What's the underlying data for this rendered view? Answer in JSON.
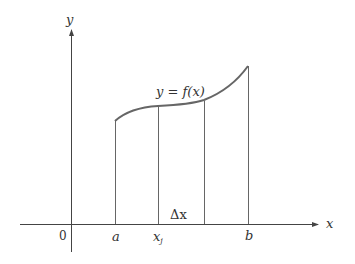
{
  "diagram": {
    "axes": {
      "x_label": "x",
      "y_label": "y",
      "origin_label": "0"
    },
    "curve": {
      "label": "y = f(x)",
      "color": "#555555"
    },
    "ticks": {
      "a": "a",
      "xj": "x",
      "xj_sub": "j",
      "b": "b"
    },
    "delta_label": "Δx",
    "colors": {
      "axis": "#444444",
      "line": "#555555",
      "text": "#333333"
    }
  }
}
